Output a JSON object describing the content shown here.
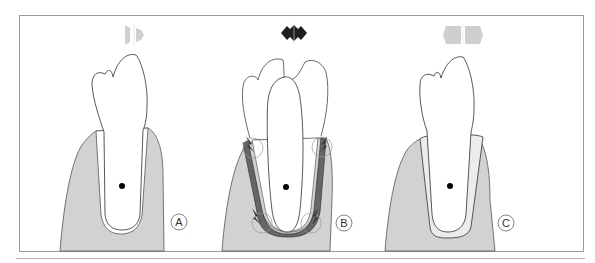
{
  "figure": {
    "panels": [
      {
        "label": "A",
        "arrow": "light-gray-bidirectional-arrow",
        "description": "healthy tooth with normal periodontal ligament"
      },
      {
        "label": "B",
        "arrow": "dark-jiggling-arrow",
        "description": "jiggling tooth with pressure/tension zones"
      },
      {
        "label": "C",
        "arrow": "light-gray-bidirectional-arrow",
        "description": "tooth with widened periodontal ligament space"
      }
    ],
    "colors": {
      "bone": "#d2d2d2",
      "frame": "#9a9a9a",
      "arrow_light": "#cfcfcf",
      "arrow_dark": "#1f1f1f",
      "ligament_dark": "#555555"
    }
  }
}
